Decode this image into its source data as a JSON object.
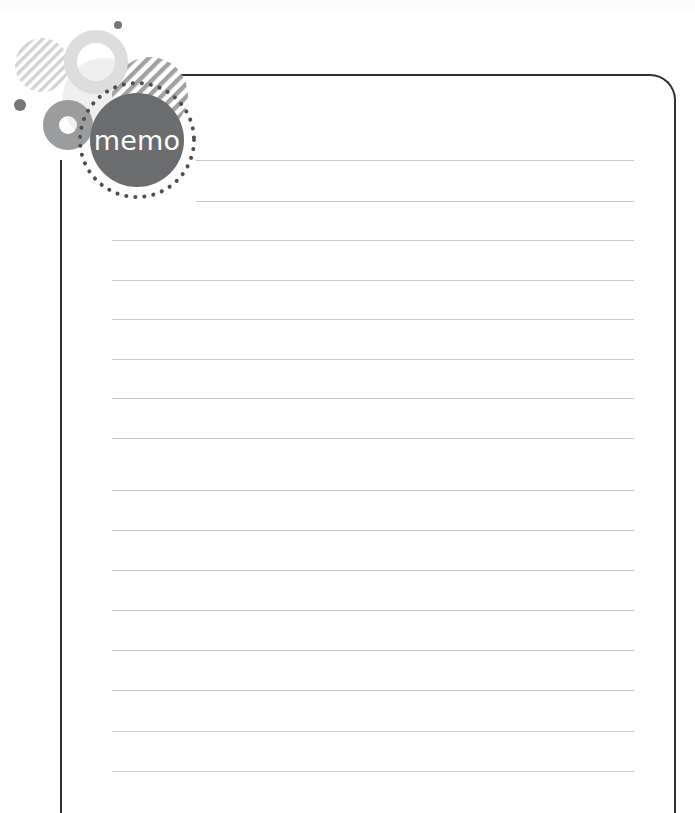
{
  "page": {
    "title": "memo",
    "width": 695,
    "height": 813,
    "background": "#ffffff"
  },
  "colors": {
    "frame_border": "#2f3031",
    "rule_line": "#c9cbcc",
    "badge_fill": "#6b6c6e",
    "badge_text": "#ffffff",
    "ring_light": "#dcdddd",
    "ring_mid": "#9b9c9d",
    "blob_pale": "#eeeeee",
    "stripe_light": "#cfd0d1",
    "stripe_mid": "#9b9c9d",
    "dot_dark": "#6b6c6e",
    "dotted_ring": "#4d4e50",
    "top_band": "#fbfbfb"
  },
  "badge": {
    "label": "memo"
  },
  "note": {
    "frame": {
      "left": 160,
      "top": 74,
      "width": 516,
      "height": 739,
      "corner_radius": 26
    },
    "left_rule": {
      "left": 60,
      "top": 160,
      "height": 653
    },
    "lines": [
      {
        "x": 196,
        "y": 160,
        "width": 438
      },
      {
        "x": 196,
        "y": 201,
        "width": 438
      },
      {
        "x": 112,
        "y": 240,
        "width": 522
      },
      {
        "x": 112,
        "y": 280,
        "width": 522
      },
      {
        "x": 112,
        "y": 319,
        "width": 522
      },
      {
        "x": 112,
        "y": 359,
        "width": 522
      },
      {
        "x": 112,
        "y": 398,
        "width": 522
      },
      {
        "x": 112,
        "y": 438,
        "width": 522
      },
      {
        "x": 112,
        "y": 490,
        "width": 522
      },
      {
        "x": 112,
        "y": 530,
        "width": 522
      },
      {
        "x": 112,
        "y": 570,
        "width": 522
      },
      {
        "x": 112,
        "y": 610,
        "width": 522
      },
      {
        "x": 112,
        "y": 650,
        "width": 522
      },
      {
        "x": 112,
        "y": 690,
        "width": 522
      },
      {
        "x": 112,
        "y": 731,
        "width": 522
      },
      {
        "x": 112,
        "y": 771,
        "width": 522
      }
    ]
  },
  "decorations": {
    "striped_circle_small": {
      "cx": 42,
      "cy": 65,
      "r": 27,
      "angle": 45
    },
    "striped_circle_large": {
      "cx": 150,
      "cy": 95,
      "r": 38,
      "angle": 45
    },
    "ring_light": {
      "cx": 96,
      "cy": 62,
      "r_outer": 32,
      "r_inner": 19
    },
    "blob_pale": {
      "cx": 104,
      "cy": 100,
      "r": 42
    },
    "ring_mid": {
      "cx": 68,
      "cy": 125,
      "r_outer": 25,
      "r_inner": 9
    },
    "dot_top": {
      "cx": 118,
      "cy": 25,
      "r": 4
    },
    "dot_left": {
      "cx": 20,
      "cy": 105,
      "r": 6
    },
    "dotted_ring": {
      "cx": 137,
      "cy": 140,
      "r": 57,
      "dot_r": 2
    }
  }
}
